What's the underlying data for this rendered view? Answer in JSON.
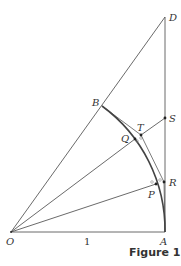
{
  "figure": {
    "caption": "Figure 1",
    "unit_label": "1",
    "points": {
      "O": {
        "label": "O",
        "x": 11,
        "y": 232
      },
      "A": {
        "label": "A",
        "x": 165,
        "y": 232
      },
      "D": {
        "label": "D",
        "x": 165,
        "y": 17
      },
      "B": {
        "label": "B",
        "x": 102,
        "y": 106
      },
      "S": {
        "label": "S",
        "x": 165,
        "y": 118
      },
      "T": {
        "label": "T",
        "x": 141,
        "y": 135
      },
      "Q": {
        "label": "Q",
        "x": 135,
        "y": 139
      },
      "R": {
        "label": "R",
        "x": 164,
        "y": 182
      },
      "P": {
        "label": "P",
        "x": 156,
        "y": 184
      }
    },
    "colors": {
      "line": "#444444",
      "text": "#333333"
    }
  }
}
